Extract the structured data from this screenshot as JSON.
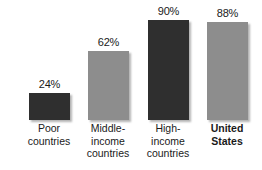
{
  "chart_data": {
    "type": "bar",
    "title": "",
    "subtitle": "",
    "xlabel": "",
    "ylabel": "",
    "ylim": [
      0,
      100
    ],
    "grid": false,
    "legend": "none",
    "categories": [
      "Poor countries",
      "Middle-income countries",
      "High-income countries",
      "United States"
    ],
    "category_lines": [
      [
        "Poor",
        "countries"
      ],
      [
        "Middle-",
        "income",
        "countries"
      ],
      [
        "High-",
        "income",
        "countries"
      ],
      [
        "United",
        "States"
      ]
    ],
    "values": [
      24,
      62,
      90,
      88
    ],
    "value_labels": [
      "24%",
      "62%",
      "90%",
      "88%"
    ],
    "bar_colors": [
      "#2f2f2f",
      "#8d8d8d",
      "#2f2f2f",
      "#8d8d8d"
    ],
    "bar_styles": [
      "dark",
      "light",
      "dark",
      "light"
    ],
    "emphasis": [
      false,
      false,
      false,
      true
    ]
  },
  "colors": {
    "background": "#ffffff",
    "bar_dark": "#2f2f2f",
    "bar_light": "#8d8d8d",
    "text": "#1a1a1a"
  }
}
